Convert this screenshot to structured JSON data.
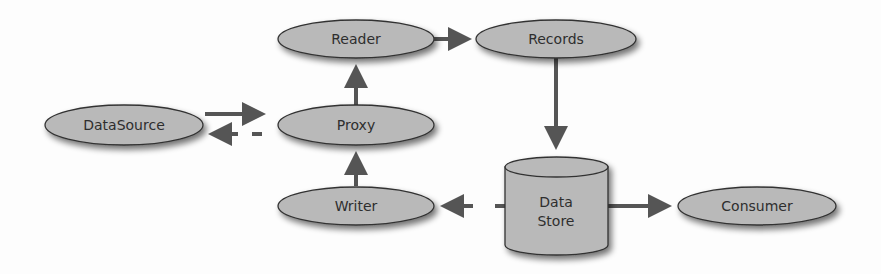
{
  "diagram": {
    "type": "data-flow",
    "colors": {
      "node_fill": "#b9b9b9",
      "node_stroke": "#333333",
      "arrow": "#555555",
      "text": "#2e2e2e",
      "background": "#fdfdfd"
    },
    "nodes": {
      "reader": {
        "label": "Reader",
        "shape": "ellipse"
      },
      "records": {
        "label": "Records",
        "shape": "ellipse"
      },
      "datasource": {
        "label": "DataSource",
        "shape": "ellipse"
      },
      "proxy": {
        "label": "Proxy",
        "shape": "ellipse"
      },
      "writer": {
        "label": "Writer",
        "shape": "ellipse"
      },
      "datastore": {
        "label_line1": "Data",
        "label_line2": "Store",
        "shape": "cylinder"
      },
      "consumer": {
        "label": "Consumer",
        "shape": "ellipse"
      }
    },
    "edges": [
      {
        "from": "Reader",
        "to": "Records",
        "style": "solid"
      },
      {
        "from": "Records",
        "to": "Data Store",
        "style": "solid"
      },
      {
        "from": "DataSource",
        "to": "Proxy",
        "style": "solid"
      },
      {
        "from": "Proxy",
        "to": "DataSource",
        "style": "dashed"
      },
      {
        "from": "Proxy",
        "to": "Reader",
        "style": "solid"
      },
      {
        "from": "Writer",
        "to": "Proxy",
        "style": "solid"
      },
      {
        "from": "Data Store",
        "to": "Writer",
        "style": "dashed"
      },
      {
        "from": "Data Store",
        "to": "Consumer",
        "style": "solid"
      }
    ]
  }
}
